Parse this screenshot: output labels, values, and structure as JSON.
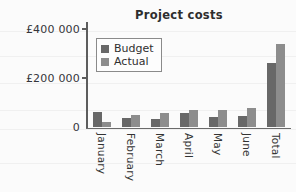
{
  "chart_data": {
    "type": "bar",
    "title": "Project costs",
    "xlabel": "",
    "ylabel": "",
    "ylim": [
      0,
      420000
    ],
    "grid": true,
    "legend_position": "top-left-inside",
    "currency_symbol": "£",
    "categories": [
      "January",
      "February",
      "March",
      "April",
      "May",
      "June",
      "Total"
    ],
    "ytick_values": [
      0,
      200000,
      400000
    ],
    "ytick_labels": [
      "0",
      "£200 000",
      "£400 000"
    ],
    "series": [
      {
        "name": "Budget",
        "color": "#686868",
        "values": [
          60000,
          35000,
          32000,
          58000,
          42000,
          44000,
          261000
        ]
      },
      {
        "name": "Actual",
        "color": "#8d8d8d",
        "values": [
          22000,
          47000,
          57000,
          68000,
          69000,
          79000,
          337000
        ]
      }
    ],
    "gridline_values": [
      0,
      100000,
      200000,
      300000,
      400000
    ]
  }
}
